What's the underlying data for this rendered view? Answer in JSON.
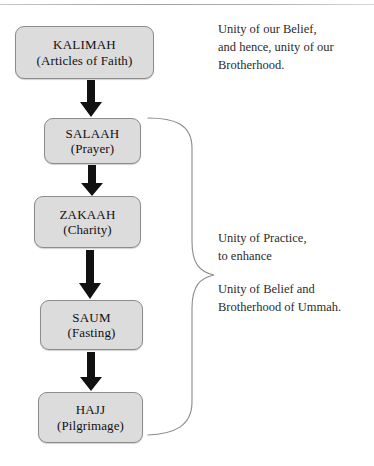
{
  "diagram": {
    "title_rule": "top-divider",
    "colors": {
      "node_fill": "#dcdcdc",
      "node_border": "#8c8c8c",
      "arrow": "#111111",
      "brace": "#8a8a8a",
      "text": "#1a1a1a"
    },
    "nodes": [
      {
        "id": "kalimah",
        "name": "KALIMAH",
        "subtitle": "(Articles of Faith)"
      },
      {
        "id": "salaah",
        "name": "SALAAH",
        "subtitle": "(Prayer)"
      },
      {
        "id": "zakaah",
        "name": "ZAKAAH",
        "subtitle": "(Charity)"
      },
      {
        "id": "saum",
        "name": "SAUM",
        "subtitle": "(Fasting)"
      },
      {
        "id": "hajj",
        "name": "HAJJ",
        "subtitle": "(Pilgrimage)"
      }
    ],
    "arrows": [
      {
        "id": "kalimah-to-salaah",
        "from": "kalimah",
        "to": "salaah"
      },
      {
        "id": "salaah-to-zakaah",
        "from": "salaah",
        "to": "zakaah"
      },
      {
        "id": "zakaah-to-saum",
        "from": "zakaah",
        "to": "saum"
      },
      {
        "id": "saum-to-hajj",
        "from": "saum",
        "to": "hajj"
      }
    ],
    "notes": [
      {
        "id": "note-belief",
        "text": "Unity of our Belief,\nand hence, unity of our\nBrotherhood."
      },
      {
        "id": "note-practice",
        "text": "Unity of Practice,\nto enhance"
      },
      {
        "id": "note-ummah",
        "text": "Unity of Belief and\nBrotherhood of Ummah."
      }
    ],
    "brace": {
      "id": "pillars-brace",
      "groups": "salaah, zakaah, saum, hajj"
    }
  }
}
